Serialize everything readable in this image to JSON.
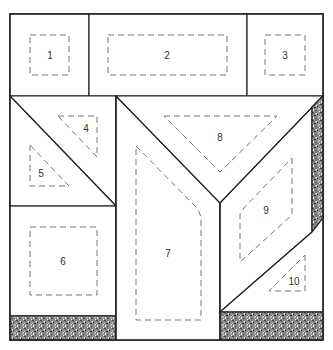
{
  "diagram": {
    "type": "quilt-block-pattern",
    "pieces": [
      {
        "id": "1",
        "label": "1",
        "shape": "square"
      },
      {
        "id": "2",
        "label": "2",
        "shape": "rectangle"
      },
      {
        "id": "3",
        "label": "3",
        "shape": "square"
      },
      {
        "id": "4",
        "label": "4",
        "shape": "triangle"
      },
      {
        "id": "5",
        "label": "5",
        "shape": "triangle"
      },
      {
        "id": "6",
        "label": "6",
        "shape": "square"
      },
      {
        "id": "7",
        "label": "7",
        "shape": "pentagon"
      },
      {
        "id": "8",
        "label": "8",
        "shape": "triangle"
      },
      {
        "id": "9",
        "label": "9",
        "shape": "parallelogram"
      },
      {
        "id": "10",
        "label": "10",
        "shape": "triangle"
      }
    ],
    "colors": {
      "outline": "#222222",
      "seam": "#777777",
      "fabric_light": "#ffffff",
      "fabric_textured": "#7a7a7a"
    },
    "legend": {
      "solid_line": "cut line",
      "dashed_line": "seam / sewing line",
      "textured_fill": "patterned fabric"
    }
  }
}
